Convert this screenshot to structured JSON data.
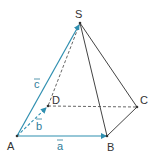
{
  "figure": {
    "type": "pyramid",
    "colors": {
      "edge": "#444444",
      "vector": "#2f8fb0",
      "label": "#333333",
      "vector_label": "#2f7d9a"
    },
    "vertices": {
      "S": {
        "label": "S"
      },
      "A": {
        "label": "A"
      },
      "B": {
        "label": "B"
      },
      "C": {
        "label": "C"
      },
      "D": {
        "label": "D"
      }
    },
    "vectors": {
      "a": {
        "label": "a",
        "from": "A",
        "to": "B"
      },
      "b": {
        "label": "b",
        "from": "A",
        "to": "D"
      },
      "c": {
        "label": "c",
        "from": "A",
        "to": "S"
      }
    },
    "edges_solid": [
      "SB",
      "SC",
      "BC"
    ],
    "edges_dashed": [
      "SD",
      "DC"
    ]
  }
}
